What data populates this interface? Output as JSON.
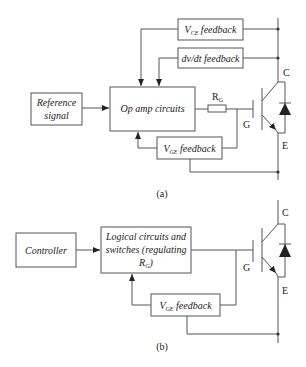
{
  "diagram_a": {
    "caption": "(a)",
    "blocks": {
      "vce_feedback": {
        "main": "V",
        "sub": "CE",
        "rest": " feedback"
      },
      "dvdt_feedback": {
        "label": "dv/dt feedback"
      },
      "reference_signal": {
        "line1": "Reference",
        "line2": "signal"
      },
      "op_amp": {
        "label": "Op amp circuits"
      },
      "vge_feedback": {
        "main": "V",
        "sub": "GE",
        "rest": " feedback"
      }
    },
    "resistor": {
      "main": "R",
      "sub": "G"
    },
    "terminals": {
      "collector": "C",
      "gate": "G",
      "emitter": "E"
    }
  },
  "diagram_b": {
    "caption": "(b)",
    "blocks": {
      "controller": {
        "label": "Controller"
      },
      "logic": {
        "line1": "Logical circuits and",
        "line2": "switches (regulating",
        "line3_main": "R",
        "line3_sub": "G",
        "line3_rest": ")"
      },
      "vge_feedback": {
        "main": "V",
        "sub": "GE",
        "rest": " feedback"
      }
    },
    "terminals": {
      "collector": "C",
      "gate": "G",
      "emitter": "E"
    }
  },
  "colors": {
    "line": "#555555",
    "text": "#222222",
    "background": "#ffffff"
  }
}
